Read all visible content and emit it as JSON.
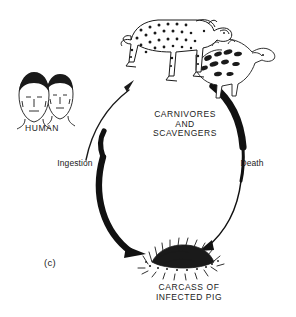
{
  "figure": {
    "panel_label": "(c)",
    "background_color": "#ffffff",
    "ink_color": "#000000",
    "type": "life-cycle-loop-diagram"
  },
  "nodes": [
    {
      "id": "human",
      "label": "HUMAN",
      "icon": "two-human-heads-icon",
      "position": "left"
    },
    {
      "id": "carnivores",
      "label": "CARNIVORES\nAND\nSCAVENGERS",
      "line1": "CARNIVORES",
      "line2": "AND",
      "line3": "SCAVENGERS",
      "icon": "leopard-and-hyena-icon",
      "position": "top"
    },
    {
      "id": "carcass",
      "label": "CARCASS OF\nINFECTED PIG",
      "line1": "CARCASS OF",
      "line2": "INFECTED PIG",
      "icon": "pig-carcass-icon",
      "position": "bottom"
    }
  ],
  "arrows": [
    {
      "id": "ingestion",
      "label": "Ingestion",
      "from": "carcass",
      "to": "human",
      "style": "thick-black-arc",
      "side": "left"
    },
    {
      "id": "death",
      "label": "Death",
      "from": "carnivores",
      "to": "carcass",
      "style": "thick-to-thin-black-arc",
      "side": "right"
    },
    {
      "id": "human-to-carnivores",
      "label": "",
      "from": "human",
      "to": "carnivores",
      "style": "thin-curved-arrow",
      "side": "upper-left"
    }
  ]
}
